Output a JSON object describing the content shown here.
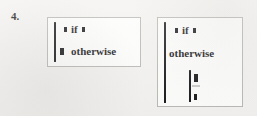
{
  "page": {
    "background_color": "#f2f1ef",
    "ink_color": "#17171a",
    "frame_color": "#b9b8b4"
  },
  "item": {
    "number_label": "4."
  },
  "expressions": [
    {
      "id": "expr-1",
      "name": "piecewise-expression-left",
      "rows": [
        {
          "leading_placeholder": "filled-square-mark",
          "condition": "if",
          "trailing_placeholder": "filled-square-mark"
        },
        {
          "leading_placeholder": "filled-square-mark",
          "condition": "otherwise",
          "trailing_placeholder": ""
        }
      ]
    },
    {
      "id": "expr-2",
      "name": "piecewise-expression-right",
      "rows": [
        {
          "leading_placeholder": "filled-square-mark",
          "condition": "if",
          "trailing_placeholder": "filled-square-mark"
        },
        {
          "leading_placeholder": "",
          "condition": "otherwise",
          "trailing_placeholder": ""
        }
      ],
      "nested": {
        "bracket": "vertical-bar",
        "marks": [
          "filled-square-mark",
          "filled-square-mark"
        ]
      }
    }
  ]
}
